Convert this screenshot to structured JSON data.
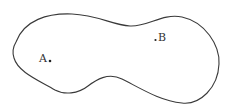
{
  "diagram": {
    "type": "closed-region",
    "stroke_color": "#3a3a3a",
    "fill_color": "#ffffff",
    "points": [
      {
        "id": "A",
        "label": "A",
        "x": 49,
        "y": 61,
        "label_position": "left"
      },
      {
        "id": "B",
        "label": "B",
        "x": 156,
        "y": 40,
        "label_position": "right"
      }
    ]
  }
}
